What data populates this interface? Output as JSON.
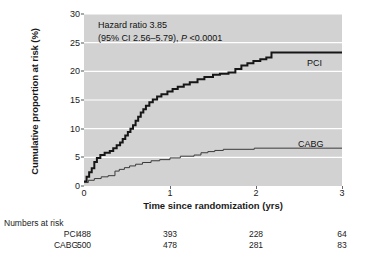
{
  "chart_data": {
    "type": "line",
    "title": "",
    "xlabel": "Time since randomization (yrs)",
    "ylabel": "Cumulative proportion at risk (%)",
    "xlim": [
      0,
      3
    ],
    "ylim": [
      0,
      30
    ],
    "xticks": [
      "0",
      "1",
      "2",
      "3"
    ],
    "yticks": [
      "0",
      "5",
      "10",
      "15",
      "20",
      "25",
      "30"
    ],
    "grid": "horizontal-white",
    "legend_position": "inline-right",
    "annotation_line1": "Hazard ratio 3.85",
    "annotation_line2_pre": "(95% CI 2.56–5.79), ",
    "annotation_line2_italic": "P",
    "annotation_line2_post": " <0.0001",
    "series": [
      {
        "name": "PCI",
        "color": "#161616",
        "width": 2.0,
        "points": [
          [
            0.0,
            0.8
          ],
          [
            0.03,
            0.8
          ],
          [
            0.03,
            1.6
          ],
          [
            0.06,
            1.6
          ],
          [
            0.06,
            2.4
          ],
          [
            0.09,
            2.4
          ],
          [
            0.09,
            3.1
          ],
          [
            0.12,
            3.1
          ],
          [
            0.12,
            4.2
          ],
          [
            0.15,
            4.2
          ],
          [
            0.15,
            4.9
          ],
          [
            0.19,
            4.9
          ],
          [
            0.19,
            5.4
          ],
          [
            0.24,
            5.4
          ],
          [
            0.24,
            5.8
          ],
          [
            0.3,
            5.8
          ],
          [
            0.3,
            6.1
          ],
          [
            0.34,
            6.1
          ],
          [
            0.34,
            6.6
          ],
          [
            0.38,
            6.6
          ],
          [
            0.38,
            7.1
          ],
          [
            0.42,
            7.1
          ],
          [
            0.42,
            7.6
          ],
          [
            0.45,
            7.6
          ],
          [
            0.45,
            8.2
          ],
          [
            0.48,
            8.2
          ],
          [
            0.48,
            8.8
          ],
          [
            0.51,
            8.8
          ],
          [
            0.51,
            9.4
          ],
          [
            0.54,
            9.4
          ],
          [
            0.54,
            10.0
          ],
          [
            0.57,
            10.0
          ],
          [
            0.57,
            10.6
          ],
          [
            0.6,
            10.6
          ],
          [
            0.6,
            11.4
          ],
          [
            0.63,
            11.4
          ],
          [
            0.63,
            12.1
          ],
          [
            0.66,
            12.1
          ],
          [
            0.66,
            12.8
          ],
          [
            0.69,
            12.8
          ],
          [
            0.69,
            13.4
          ],
          [
            0.72,
            13.4
          ],
          [
            0.72,
            14.0
          ],
          [
            0.76,
            14.0
          ],
          [
            0.76,
            14.6
          ],
          [
            0.8,
            14.6
          ],
          [
            0.8,
            15.1
          ],
          [
            0.85,
            15.1
          ],
          [
            0.85,
            15.6
          ],
          [
            0.9,
            15.6
          ],
          [
            0.9,
            16.0
          ],
          [
            0.97,
            16.0
          ],
          [
            0.97,
            16.5
          ],
          [
            1.03,
            16.5
          ],
          [
            1.03,
            16.9
          ],
          [
            1.09,
            16.9
          ],
          [
            1.09,
            17.3
          ],
          [
            1.16,
            17.3
          ],
          [
            1.16,
            17.7
          ],
          [
            1.23,
            17.7
          ],
          [
            1.23,
            18.1
          ],
          [
            1.32,
            18.1
          ],
          [
            1.32,
            18.6
          ],
          [
            1.4,
            18.6
          ],
          [
            1.4,
            19.0
          ],
          [
            1.5,
            19.0
          ],
          [
            1.5,
            19.4
          ],
          [
            1.58,
            19.4
          ],
          [
            1.58,
            19.6
          ],
          [
            1.68,
            19.6
          ],
          [
            1.68,
            19.8
          ],
          [
            1.76,
            19.8
          ],
          [
            1.76,
            20.4
          ],
          [
            1.83,
            20.4
          ],
          [
            1.83,
            21.0
          ],
          [
            1.9,
            21.0
          ],
          [
            1.9,
            21.4
          ],
          [
            1.97,
            21.4
          ],
          [
            1.97,
            21.8
          ],
          [
            2.05,
            21.8
          ],
          [
            2.05,
            22.1
          ],
          [
            2.12,
            22.1
          ],
          [
            2.12,
            22.4
          ],
          [
            2.18,
            22.4
          ],
          [
            2.18,
            23.3
          ],
          [
            3.0,
            23.3
          ]
        ]
      },
      {
        "name": "CABG",
        "color": "#3a3a3a",
        "width": 1.0,
        "points": [
          [
            0.0,
            0.6
          ],
          [
            0.05,
            0.6
          ],
          [
            0.05,
            1.0
          ],
          [
            0.12,
            1.0
          ],
          [
            0.12,
            1.3
          ],
          [
            0.2,
            1.3
          ],
          [
            0.2,
            1.6
          ],
          [
            0.28,
            1.6
          ],
          [
            0.28,
            1.8
          ],
          [
            0.36,
            1.8
          ],
          [
            0.36,
            2.6
          ],
          [
            0.41,
            2.6
          ],
          [
            0.41,
            2.9
          ],
          [
            0.47,
            2.9
          ],
          [
            0.47,
            3.2
          ],
          [
            0.53,
            3.2
          ],
          [
            0.53,
            3.5
          ],
          [
            0.6,
            3.5
          ],
          [
            0.6,
            3.8
          ],
          [
            0.68,
            3.8
          ],
          [
            0.68,
            4.1
          ],
          [
            0.78,
            4.1
          ],
          [
            0.78,
            4.4
          ],
          [
            0.88,
            4.4
          ],
          [
            0.88,
            4.6
          ],
          [
            1.0,
            4.6
          ],
          [
            1.0,
            4.9
          ],
          [
            1.12,
            4.9
          ],
          [
            1.12,
            5.2
          ],
          [
            1.28,
            5.2
          ],
          [
            1.28,
            5.4
          ],
          [
            1.36,
            5.4
          ],
          [
            1.36,
            5.8
          ],
          [
            1.44,
            5.8
          ],
          [
            1.44,
            6.0
          ],
          [
            1.52,
            6.0
          ],
          [
            1.52,
            6.2
          ],
          [
            1.62,
            6.2
          ],
          [
            1.62,
            6.4
          ],
          [
            1.98,
            6.4
          ],
          [
            1.98,
            6.6
          ],
          [
            3.0,
            6.6
          ]
        ]
      }
    ]
  },
  "risk_table": {
    "title": "Numbers at risk",
    "rows": [
      {
        "label": "PCI",
        "values": [
          "488",
          "393",
          "228",
          "64"
        ]
      },
      {
        "label": "CABG",
        "values": [
          "500",
          "478",
          "281",
          "83"
        ]
      }
    ]
  }
}
